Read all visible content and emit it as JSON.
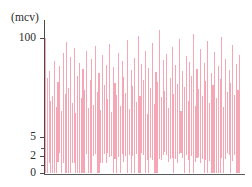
{
  "chart_data": {
    "type": "bar",
    "title": "",
    "subtitle": "",
    "xlabel": "",
    "ylabel": "(mcv)",
    "unit_label": "(mcv)",
    "grid": false,
    "legend": null,
    "axis": {
      "y_scale": "log-like-compressed",
      "y_tick_labels": [
        "100",
        "5",
        "2",
        "0"
      ],
      "y_tick_values": [
        100,
        5,
        2,
        0
      ],
      "y_tick_pixel_y": [
        38,
        137,
        156,
        173
      ],
      "y_minor_tick_pixel_y": [
        148,
        165
      ],
      "x_tick_labels": [],
      "ylim": [
        0,
        120
      ],
      "bar_color": "#f5a7b6",
      "axis_color": "#4a4a4a",
      "text_color": "#2b2b2b"
    },
    "categories": [
      "1",
      "2",
      "3",
      "4",
      "5",
      "6",
      "7",
      "8",
      "9",
      "10",
      "11",
      "12",
      "13",
      "14",
      "15",
      "16",
      "17",
      "18",
      "19",
      "20",
      "21",
      "22",
      "23",
      "24",
      "25",
      "26",
      "27",
      "28",
      "29",
      "30",
      "31",
      "32",
      "33",
      "34",
      "35",
      "36",
      "37",
      "38",
      "39",
      "40",
      "41",
      "42",
      "43",
      "44",
      "45",
      "46",
      "47",
      "48",
      "49",
      "50",
      "51",
      "52",
      "53",
      "54",
      "55",
      "56",
      "57",
      "58",
      "59",
      "60",
      "61",
      "62",
      "63",
      "64",
      "65",
      "66",
      "67",
      "68",
      "69",
      "70",
      "71",
      "72",
      "73",
      "74",
      "75",
      "76",
      "77",
      "78",
      "79",
      "80",
      "81",
      "82",
      "83",
      "84",
      "85",
      "86",
      "87",
      "88",
      "89",
      "90",
      "91",
      "92",
      "93",
      "94",
      "95",
      "96",
      "97",
      "98",
      "99",
      "100",
      "101",
      "102",
      "103",
      "104",
      "105",
      "106",
      "107",
      "108",
      "109",
      "110"
    ],
    "values": [
      100,
      62,
      68,
      40,
      44,
      78,
      34,
      58,
      73,
      30,
      86,
      46,
      96,
      52,
      82,
      38,
      90,
      28,
      64,
      76,
      42,
      70,
      50,
      88,
      33,
      60,
      80,
      36,
      92,
      48,
      66,
      31,
      84,
      55,
      74,
      41,
      94,
      29,
      72,
      57,
      45,
      86,
      35,
      78,
      63,
      47,
      98,
      32,
      69,
      54,
      81,
      39,
      102,
      44,
      75,
      60,
      88,
      27,
      71,
      52,
      95,
      37,
      67,
      58,
      108,
      43,
      79,
      49,
      85,
      33,
      62,
      91,
      46,
      74,
      56,
      99,
      30,
      68,
      53,
      83,
      40,
      77,
      64,
      104,
      35,
      70,
      51,
      89,
      44,
      76,
      59,
      97,
      38,
      66,
      55,
      87,
      42,
      73,
      61,
      101,
      34,
      80,
      48,
      69,
      57,
      93,
      45,
      75,
      50,
      84
    ]
  }
}
